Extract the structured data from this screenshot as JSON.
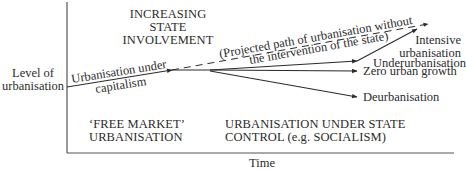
{
  "axes": {
    "y_label_line1": "Level of",
    "y_label_line2": "urbanisation",
    "x_label": "Time"
  },
  "regions": {
    "top_line1": "INCREASING",
    "top_line2": "STATE",
    "top_line3": "INVOLVEMENT",
    "free_market_line1": "‘FREE MARKET’",
    "free_market_line2": "URBANISATION",
    "state_control_line1": "URBANISATION UNDER STATE",
    "state_control_line2": "CONTROL (e.g. SOCIALISM)"
  },
  "paths": {
    "capitalism_line1": "Urbanisation under",
    "capitalism_line2": "capitalism",
    "projected_line1": "(Projected path of urbanisation without",
    "projected_line2": "the intervention of the state)",
    "intensive_line1": "Intensive",
    "intensive_line2": "urbanisation",
    "underurbanisation": "Underurbanisation",
    "zero_growth": "Zero urban growth",
    "deurbanisation": "Deurbanisation"
  },
  "colors": {
    "line": "#2a2a2a",
    "axis": "#555555",
    "text": "#2b2b2b"
  }
}
